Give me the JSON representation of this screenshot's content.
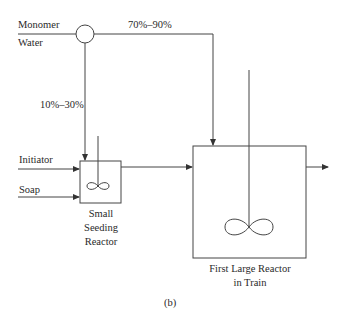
{
  "diagram": {
    "type": "process-flow",
    "caption": "(b)",
    "inputs": {
      "monomer": "Monomer",
      "water": "Water",
      "initiator": "Initiator",
      "soap": "Soap"
    },
    "splits": {
      "to_large_reactor": "70%–90%",
      "to_seeding_reactor": "10%–30%"
    },
    "units": {
      "seeding_reactor": [
        "Small",
        "Seeding",
        "Reactor"
      ],
      "large_reactor": [
        "First Large Reactor",
        "in Train"
      ]
    },
    "colors": {
      "line": "#333333",
      "background": "#ffffff"
    }
  }
}
